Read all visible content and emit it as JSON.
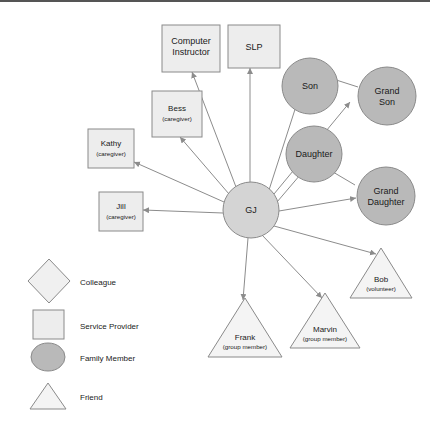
{
  "diagram": {
    "ego": {
      "label": "GJ"
    },
    "nodes": [
      {
        "id": "computer-instructor",
        "name": "Computer\nInstructor",
        "name_line1": "Computer",
        "name_line2": "Instructor",
        "sub": "",
        "category": "Service Provider",
        "shape": "square"
      },
      {
        "id": "slp",
        "name": "SLP",
        "sub": "",
        "category": "Service Provider",
        "shape": "square"
      },
      {
        "id": "bess",
        "name": "Bess",
        "sub": "(caregiver)",
        "category": "Service Provider",
        "shape": "square"
      },
      {
        "id": "kathy",
        "name": "Kathy",
        "sub": "(caregiver)",
        "category": "Service Provider",
        "shape": "square"
      },
      {
        "id": "jill",
        "name": "Jill",
        "sub": "(caregiver)",
        "category": "Service Provider",
        "shape": "square"
      },
      {
        "id": "son",
        "name": "Son",
        "sub": "",
        "category": "Family Member",
        "shape": "circle"
      },
      {
        "id": "grand-son",
        "name_line1": "Grand",
        "name_line2": "Son",
        "name": "Grand Son",
        "sub": "",
        "category": "Family Member",
        "shape": "circle"
      },
      {
        "id": "daughter",
        "name": "Daughter",
        "sub": "",
        "category": "Family Member",
        "shape": "circle"
      },
      {
        "id": "grand-daughter",
        "name_line1": "Grand",
        "name_line2": "Daughter",
        "name": "Grand Daughter",
        "sub": "",
        "category": "Family Member",
        "shape": "circle"
      },
      {
        "id": "bob",
        "name": "Bob",
        "sub": "(volunteer)",
        "category": "Friend",
        "shape": "triangle"
      },
      {
        "id": "marvin",
        "name": "Marvin",
        "sub": "(group member)",
        "category": "Friend",
        "shape": "triangle"
      },
      {
        "id": "frank",
        "name": "Frank",
        "sub": "(group member)",
        "category": "Friend",
        "shape": "triangle"
      }
    ],
    "edges": [
      {
        "from": "GJ",
        "to": "computer-instructor"
      },
      {
        "from": "GJ",
        "to": "slp"
      },
      {
        "from": "GJ",
        "to": "bess"
      },
      {
        "from": "GJ",
        "to": "kathy"
      },
      {
        "from": "GJ",
        "to": "jill"
      },
      {
        "from": "GJ",
        "to": "son"
      },
      {
        "from": "GJ",
        "to": "grand-son"
      },
      {
        "from": "GJ",
        "to": "daughter"
      },
      {
        "from": "GJ",
        "to": "grand-daughter"
      },
      {
        "from": "GJ",
        "to": "bob"
      },
      {
        "from": "GJ",
        "to": "marvin"
      },
      {
        "from": "GJ",
        "to": "frank"
      },
      {
        "from": "son",
        "to": "grand-son"
      },
      {
        "from": "daughter",
        "to": "grand-daughter"
      }
    ]
  },
  "legend": {
    "items": [
      {
        "shape": "diamond",
        "label": "Colleague"
      },
      {
        "shape": "square",
        "label": "Service Provider"
      },
      {
        "shape": "circle",
        "label": "Family Member"
      },
      {
        "shape": "triangle",
        "label": "Friend"
      }
    ]
  },
  "colors": {
    "service_provider": "#ededed",
    "family_member": "#b9b9b9",
    "ego": "#d4d4d4",
    "friend": "#f4f4f4",
    "colleague": "#f0f0f0",
    "outline": "#8a8a8a",
    "edge": "#8c8c8c"
  }
}
